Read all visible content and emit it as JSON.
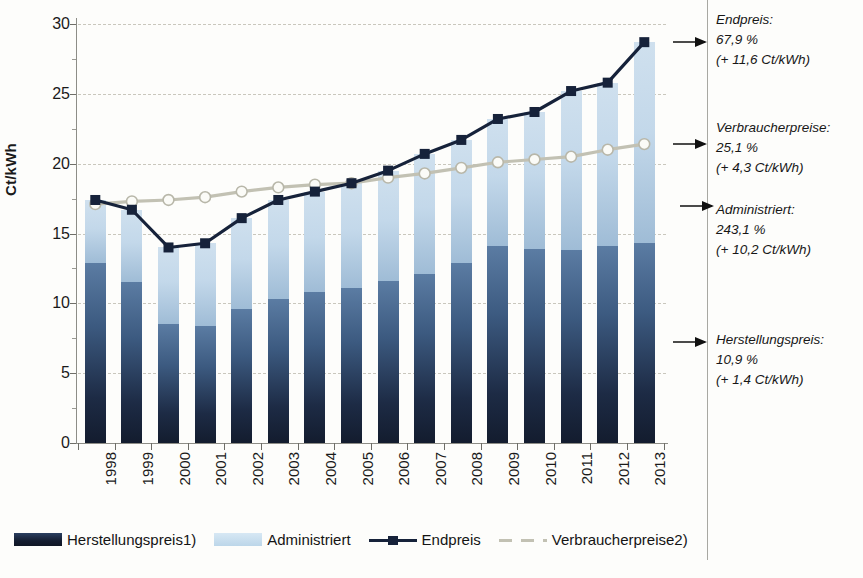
{
  "chart_data": {
    "type": "bar",
    "title": "",
    "xlabel": "",
    "ylabel": "Ct/kWh",
    "ylim": [
      0,
      30
    ],
    "yticks": [
      0,
      5,
      10,
      15,
      20,
      25,
      30
    ],
    "grid": true,
    "legend_position": "bottom",
    "categories": [
      "1998",
      "1999",
      "2000",
      "2001",
      "2002",
      "2003",
      "2004",
      "2005",
      "2006",
      "2007",
      "2008",
      "2009",
      "2010",
      "2011",
      "2012",
      "2013"
    ],
    "series": [
      {
        "name": "Herstellungspreis1)",
        "type": "bar-stack",
        "color": "#1d2b45",
        "values": [
          12.9,
          11.5,
          8.5,
          8.4,
          9.6,
          10.3,
          10.8,
          11.1,
          11.6,
          12.1,
          12.9,
          14.1,
          13.9,
          13.8,
          14.1,
          14.3
        ]
      },
      {
        "name": "Administriert",
        "type": "bar-stack",
        "color": "#c3d8ea",
        "values": [
          4.5,
          5.2,
          5.5,
          5.9,
          6.5,
          7.1,
          7.2,
          7.5,
          7.9,
          8.6,
          8.8,
          9.1,
          9.8,
          11.4,
          11.7,
          14.4
        ]
      },
      {
        "name": "Endpreis",
        "type": "line",
        "color": "#16223a",
        "values": [
          17.4,
          16.7,
          14.0,
          14.3,
          16.1,
          17.4,
          18.0,
          18.6,
          19.5,
          20.7,
          21.7,
          23.2,
          23.7,
          25.2,
          25.8,
          28.7
        ]
      },
      {
        "name": "Verbraucherpreise2)",
        "type": "line",
        "color": "#c2c1b3",
        "values": [
          17.1,
          17.3,
          17.4,
          17.6,
          18.0,
          18.3,
          18.5,
          18.6,
          19.0,
          19.3,
          19.7,
          20.1,
          20.3,
          20.5,
          21.0,
          21.4
        ]
      }
    ],
    "annotations": [
      {
        "key": "endpreis",
        "label": "Endpreis:",
        "percent": "67,9 %",
        "delta": "(+ 11,6 Ct/kWh)",
        "target_value": 28.7
      },
      {
        "key": "verbraucher",
        "label": "Verbraucherpreise:",
        "percent": "25,1 %",
        "delta": "(+ 4,3 Ct/kWh)",
        "target_value": 21.4
      },
      {
        "key": "administriert",
        "label": "Administriert:",
        "percent": "243,1 %",
        "delta": "(+ 10,2 Ct/kWh)",
        "target_value": 17.0
      },
      {
        "key": "herstellung",
        "label": "Herstellungspreis:",
        "percent": "10,9 %",
        "delta": "(+ 1,4 Ct/kWh)",
        "target_value": 7.2
      }
    ]
  },
  "axis": {
    "y_title": "Ct/kWh",
    "y_ticks": [
      "30",
      "25",
      "20",
      "15",
      "10",
      "5",
      "0"
    ],
    "x_ticks": [
      "1998",
      "1999",
      "2000",
      "2001",
      "2002",
      "2003",
      "2004",
      "2005",
      "2006",
      "2007",
      "2008",
      "2009",
      "2010",
      "2011",
      "2012",
      "2013"
    ]
  },
  "legend": {
    "items": [
      {
        "label": "Herstellungspreis1)",
        "marker": "swatch-dark-blue"
      },
      {
        "label": "Administriert",
        "marker": "swatch-light-blue"
      },
      {
        "label": "Endpreis",
        "marker": "line-square-marker"
      },
      {
        "label": "Verbraucherpreise2)",
        "marker": "dashed-grey-line"
      }
    ]
  },
  "annotations": [
    {
      "label": "Endpreis:",
      "percent": "67,9 %",
      "delta": "(+ 11,6 Ct/kWh)"
    },
    {
      "label": "Verbraucherpreise:",
      "percent": "25,1 %",
      "delta": "(+ 4,3 Ct/kWh)"
    },
    {
      "label": "Administriert:",
      "percent": "243,1 %",
      "delta": "(+ 10,2 Ct/kWh)"
    },
    {
      "label": "Herstellungspreis:",
      "percent": "10,9 %",
      "delta": "(+ 1,4 Ct/kWh)"
    }
  ],
  "footnote": {
    "text": ""
  }
}
